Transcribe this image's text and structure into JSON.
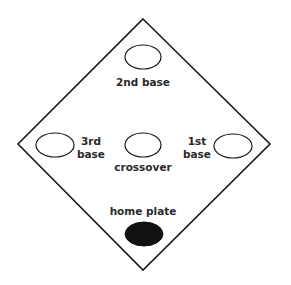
{
  "diagram": {
    "type": "baseball-diamond",
    "colors": {
      "stroke": "#1a1a1a",
      "fill_home": "#111111",
      "background": "#ffffff",
      "text": "#2a2a2a"
    },
    "diamond": {
      "top": [
        143,
        19
      ],
      "right": [
        270,
        144
      ],
      "bottom": [
        143,
        270
      ],
      "left": [
        18,
        144
      ]
    },
    "nodes": [
      {
        "id": "second-base",
        "label": "2nd base",
        "cx": 143,
        "cy": 57,
        "rx": 18,
        "ry": 12,
        "filled": false
      },
      {
        "id": "third-base",
        "label_line1": "3rd",
        "label_line2": "base",
        "cx": 55,
        "cy": 145,
        "rx": 19,
        "ry": 12,
        "filled": false
      },
      {
        "id": "crossover",
        "label": "crossover",
        "cx": 143,
        "cy": 145,
        "rx": 18,
        "ry": 12,
        "filled": false
      },
      {
        "id": "first-base",
        "label_line1": "1st",
        "label_line2": "base",
        "cx": 233,
        "cy": 146,
        "rx": 19,
        "ry": 12,
        "filled": false
      },
      {
        "id": "home-plate",
        "label": "home plate",
        "cx": 144,
        "cy": 234,
        "rx": 19,
        "ry": 12,
        "filled": true
      }
    ],
    "labels": {
      "second_base": "2nd base",
      "third_base_1": "3rd",
      "third_base_2": "base",
      "first_base_1": "1st",
      "first_base_2": "base",
      "crossover": "crossover",
      "home_plate": "home plate"
    }
  }
}
